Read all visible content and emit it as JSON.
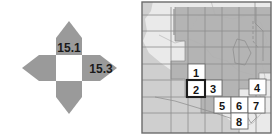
{
  "figure": {
    "panels": [
      "compass-diagram",
      "california-grid-map"
    ]
  },
  "compass": {
    "name": "directional-value-diagram",
    "center_fill": "#ffffff",
    "petal_fill": "#9a9a9a",
    "labels": [
      {
        "id": "north",
        "value": "15.1",
        "x": 69,
        "y": 48
      },
      {
        "id": "east",
        "value": "15.3",
        "x": 101,
        "y": 70
      }
    ],
    "petals": [
      {
        "id": "north-petal",
        "direction": "up"
      },
      {
        "id": "east-petal",
        "direction": "right"
      },
      {
        "id": "south-petal",
        "direction": "down"
      },
      {
        "id": "west-petal",
        "direction": "left"
      }
    ]
  },
  "map": {
    "name": "california-study-area-map",
    "ocean_color": "#cfcfcf",
    "land_color": "#eaeaea",
    "swath_color": "#b4b4b4",
    "cells": [
      {
        "id": 1,
        "label": "1",
        "x": 47,
        "y": 63,
        "w": 17,
        "h": 16,
        "highlighted": false
      },
      {
        "id": 2,
        "label": "2",
        "x": 46,
        "y": 79,
        "w": 18,
        "h": 17,
        "highlighted": true
      },
      {
        "id": 3,
        "label": "3",
        "x": 64,
        "y": 79,
        "w": 17,
        "h": 16,
        "highlighted": false
      },
      {
        "id": 4,
        "label": "4",
        "x": 108,
        "y": 78,
        "w": 17,
        "h": 16,
        "highlighted": false
      },
      {
        "id": 5,
        "label": "5",
        "x": 73,
        "y": 96,
        "w": 17,
        "h": 16,
        "highlighted": false
      },
      {
        "id": 6,
        "label": "6",
        "x": 90,
        "y": 96,
        "w": 17,
        "h": 16,
        "highlighted": false
      },
      {
        "id": 7,
        "label": "7",
        "x": 107,
        "y": 96,
        "w": 17,
        "h": 16,
        "highlighted": false
      },
      {
        "id": 8,
        "label": "8",
        "x": 90,
        "y": 112,
        "w": 17,
        "h": 16,
        "highlighted": false
      }
    ]
  }
}
